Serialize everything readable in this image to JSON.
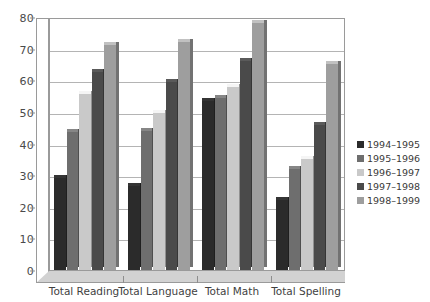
{
  "chart_data": {
    "type": "bar",
    "title": "",
    "subtitle": "",
    "xlabel": "",
    "ylabel": "",
    "ylim": [
      0,
      80
    ],
    "ytick_step": 10,
    "yticks": [
      0,
      10,
      20,
      30,
      40,
      50,
      60,
      70,
      80
    ],
    "grid": true,
    "legend_position": "right",
    "categories": [
      "Total Reading",
      "Total Language",
      "Total Math",
      "Total Spelling"
    ],
    "series": [
      {
        "name": "1994–1995",
        "color": "#2b2b2b",
        "values": [
          29,
          26.5,
          53.5,
          22
        ]
      },
      {
        "name": "1995–1996",
        "color": "#6e6e6e",
        "values": [
          43.5,
          44,
          54.5,
          32
        ]
      },
      {
        "name": "1996–1997",
        "color": "#c9c9c9",
        "values": [
          55.5,
          49.5,
          58,
          35
        ]
      },
      {
        "name": "1997–1998",
        "color": "#4a4a4a",
        "values": [
          62.5,
          59.5,
          66,
          46
        ]
      },
      {
        "name": "1998–1999",
        "color": "#9e9e9e",
        "values": [
          71,
          72,
          78,
          65
        ]
      }
    ]
  },
  "axes": {
    "y_tick_labels": [
      "80",
      "70",
      "60",
      "50",
      "40",
      "30",
      "20",
      "10",
      "0"
    ]
  },
  "legend": {
    "items": [
      {
        "label": "1994–1995",
        "color": "#2b2b2b"
      },
      {
        "label": "1995–1996",
        "color": "#6e6e6e"
      },
      {
        "label": "1996–1997",
        "color": "#c9c9c9"
      },
      {
        "label": "1997–1998",
        "color": "#4a4a4a"
      },
      {
        "label": "1998–1999",
        "color": "#9e9e9e"
      }
    ]
  }
}
